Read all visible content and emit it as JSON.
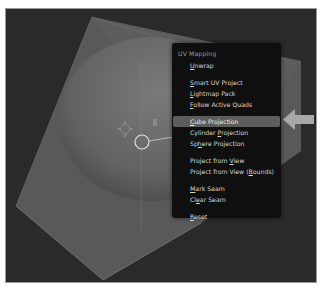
{
  "menu": {
    "title": "UV Mapping",
    "groups": [
      [
        {
          "label": "Unwrap",
          "accel": "U"
        }
      ],
      [
        {
          "label": "Smart UV Project",
          "accel": "S"
        },
        {
          "label": "Lightmap Pack",
          "accel": "L"
        },
        {
          "label": "Follow Active Quads",
          "accel": "F"
        }
      ],
      [
        {
          "label": "Cube Projection",
          "accel": "C",
          "active": true
        },
        {
          "label": "Cylinder Projection",
          "accel": "P"
        },
        {
          "label": "Sphere Projection",
          "accel": "h"
        }
      ],
      [
        {
          "label": "Project from View",
          "accel": "V"
        },
        {
          "label": "Project from View (Bounds)",
          "accel": "B"
        }
      ],
      [
        {
          "label": "Mark Seam",
          "accel": "M"
        },
        {
          "label": "Clear Seam",
          "accel": "e"
        }
      ],
      [
        {
          "label": "Reset",
          "accel": "R"
        }
      ]
    ]
  },
  "pointer_arrow": {
    "icon": "arrow-left-icon",
    "color": "#a8a8a8",
    "points_to": "Cube Projection"
  },
  "colors": {
    "viewport_bg": "#2a2a2a",
    "cube_face": "#5a5a5a",
    "sphere": "#6a6a6a",
    "menu_bg": "#0f0f0f",
    "menu_highlight": "#5d5d5d"
  }
}
